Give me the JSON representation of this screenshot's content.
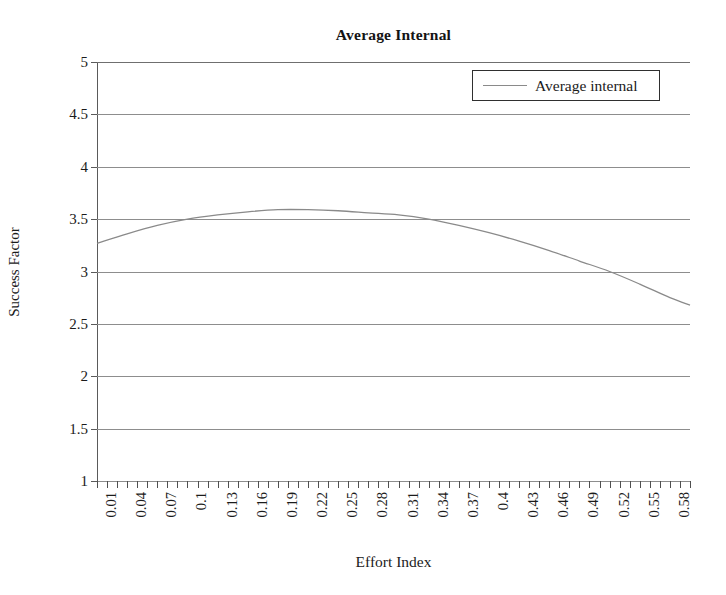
{
  "chart_data": {
    "type": "line",
    "title": "Average Internal",
    "xlabel": "Effort Index",
    "ylabel": "Success Factor",
    "grid": true,
    "legend_position": "top-right",
    "ylim": [
      1,
      5
    ],
    "ytick_labels": [
      "5",
      "4.5",
      "4",
      "3.5",
      "3",
      "2.5",
      "2",
      "1.5",
      "1"
    ],
    "ytick_values": [
      5,
      4.5,
      4,
      3.5,
      3,
      2.5,
      2,
      1.5,
      1
    ],
    "xtick_labels": [
      "0.01",
      "0.04",
      "0.07",
      "0.1",
      "0.13",
      "0.16",
      "0.19",
      "0.22",
      "0.25",
      "0.28",
      "0.31",
      "0.34",
      "0.37",
      "0.4",
      "0.43",
      "0.46",
      "0.49",
      "0.52",
      "0.55",
      "0.58"
    ],
    "xlim": [
      0.01,
      0.6
    ],
    "x_minor_step": 0.01,
    "series": [
      {
        "name": "Average internal",
        "color": "#8a8a8a",
        "x": [
          0.01,
          0.04,
          0.07,
          0.1,
          0.13,
          0.16,
          0.19,
          0.22,
          0.25,
          0.28,
          0.31,
          0.34,
          0.37,
          0.4,
          0.43,
          0.46,
          0.49,
          0.52,
          0.55,
          0.58,
          0.6
        ],
        "values": [
          3.27,
          3.36,
          3.44,
          3.5,
          3.54,
          3.57,
          3.59,
          3.59,
          3.58,
          3.56,
          3.54,
          3.5,
          3.44,
          3.37,
          3.29,
          3.2,
          3.1,
          3.0,
          2.88,
          2.75,
          2.68
        ]
      }
    ]
  },
  "legend": {
    "entries": [
      {
        "label": "Average internal"
      }
    ]
  }
}
